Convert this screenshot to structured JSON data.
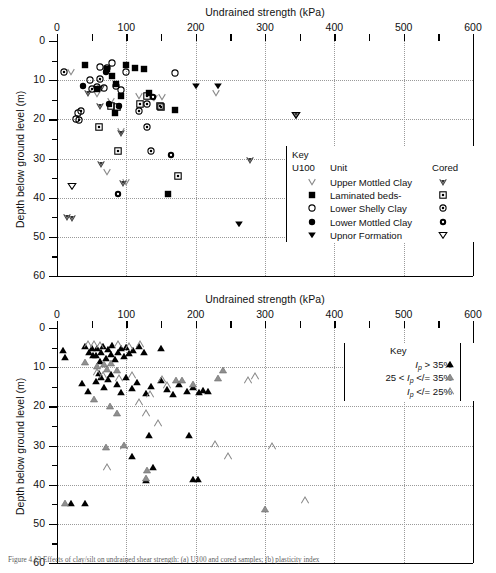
{
  "figure": {
    "caption": "Figure 4.13  Effects of clay/silt on undrained shear strength: (a) U100 and cored samples; (b) plasticity index"
  },
  "chart_data": [
    {
      "id": "top",
      "type": "scatter",
      "title": "",
      "xlabel": "Undrained strength (kPa)",
      "ylabel": "Depth below ground level (m)",
      "xlim": [
        0,
        600
      ],
      "ylim": [
        0,
        60
      ],
      "y_inverted": true,
      "xticks": [
        0,
        100,
        200,
        300,
        400,
        500,
        600
      ],
      "xticks_minor_step": 50,
      "yticks": [
        0,
        10,
        20,
        30,
        40,
        50,
        60
      ],
      "yticks_minor_step": 5,
      "grid": "dotted",
      "legend": {
        "title": "Key",
        "col_left_header": "U100",
        "col_mid_header": "Unit",
        "col_right_header": "Cored",
        "entries": [
          {
            "label": "Upper Mottled Clay",
            "u100": "open-chevron-down",
            "cored": "gray-filled-chevron-down"
          },
          {
            "label": "Laminated beds-",
            "u100": "filled-square",
            "cored": "square-with-dot"
          },
          {
            "label": "Lower Shelly Clay",
            "u100": "open-circle",
            "cored": "circle-with-dot"
          },
          {
            "label": "Lower Mottled Clay",
            "u100": "filled-circle",
            "cored": "filled-circle-with-hole"
          },
          {
            "label": "Upnor Formation",
            "u100": "filled-triangle-down",
            "cored": "open-triangle-down"
          }
        ]
      },
      "series": [
        {
          "name": "Upper Mottled Clay",
          "marker": "open-chevron-down",
          "points": [
            [
              20,
              7.8
            ],
            [
              57,
              13.5
            ],
            [
              78,
              15.2
            ],
            [
              118,
              14.0
            ],
            [
              140,
              14.6
            ],
            [
              152,
              14.3
            ],
            [
              92,
              23.0
            ],
            [
              100,
              36.0
            ],
            [
              72,
              33.5
            ],
            [
              230,
              13.4
            ]
          ]
        },
        {
          "name": "Upper Mottled Clay (cored)",
          "marker": "gray-filled-chevron-down",
          "points": [
            [
              45,
              13.3
            ],
            [
              62,
              16.5
            ],
            [
              64,
              12.0
            ],
            [
              92,
              23.5
            ],
            [
              95,
              36.2
            ],
            [
              63,
              31.5
            ],
            [
              278,
              30.5
            ],
            [
              345,
              19.0
            ],
            [
              14,
              45.0
            ],
            [
              22,
              45.1
            ]
          ]
        },
        {
          "name": "Laminated beds",
          "marker": "filled-square",
          "points": [
            [
              40,
              6.0
            ],
            [
              58,
              12.2
            ],
            [
              72,
              7.2
            ],
            [
              80,
              9.0
            ],
            [
              85,
              11.0
            ],
            [
              92,
              14.0
            ],
            [
              100,
              6.0
            ],
            [
              112,
              7.0
            ],
            [
              126,
              7.2
            ],
            [
              83,
              18.5
            ],
            [
              170,
              17.5
            ],
            [
              132,
              13.2
            ],
            [
              160,
              39.0
            ]
          ]
        },
        {
          "name": "Laminated beds (cored)",
          "marker": "square-with-dot",
          "points": [
            [
              78,
              16.5
            ],
            [
              86,
              16.8
            ],
            [
              120,
              16.0
            ],
            [
              130,
              14.0
            ],
            [
              150,
              16.8
            ],
            [
              148,
              16.5
            ],
            [
              60,
              22.0
            ],
            [
              88,
              28.0
            ],
            [
              175,
              34.5
            ]
          ]
        },
        {
          "name": "Lower Shelly Clay",
          "marker": "open-circle",
          "points": [
            [
              30,
              18.5
            ],
            [
              48,
              10.0
            ],
            [
              57,
              11.8
            ],
            [
              62,
              6.6
            ],
            [
              68,
              12.0
            ],
            [
              72,
              7.0
            ],
            [
              80,
              5.5
            ],
            [
              85,
              11.4
            ],
            [
              92,
              12.5
            ],
            [
              100,
              8.0
            ],
            [
              170,
              8.2
            ],
            [
              28,
              20.0
            ]
          ]
        },
        {
          "name": "Lower Shelly Clay (cored)",
          "marker": "circle-with-dot",
          "points": [
            [
              10,
              7.8
            ],
            [
              35,
              17.8
            ],
            [
              50,
              12.2
            ],
            [
              62,
              9.8
            ],
            [
              118,
              17.8
            ],
            [
              130,
              16.0
            ],
            [
              130,
              22.0
            ],
            [
              135,
              28.0
            ],
            [
              32,
              20.2
            ]
          ]
        },
        {
          "name": "Lower Mottled Clay",
          "marker": "filled-circle",
          "points": [
            [
              38,
              11.4
            ],
            [
              70,
              8.0
            ],
            [
              75,
              16.2
            ],
            [
              90,
              16.5
            ],
            [
              345,
              43.5
            ]
          ]
        },
        {
          "name": "Lower Mottled Clay (cored)",
          "marker": "filled-circle-with-hole",
          "points": [
            [
              138,
              14.2
            ],
            [
              165,
              29.0
            ],
            [
              88,
              39.0
            ]
          ]
        },
        {
          "name": "Upnor Formation",
          "marker": "filled-triangle-down",
          "points": [
            [
              200,
              11.5
            ],
            [
              232,
              11.5
            ],
            [
              262,
              46.8
            ]
          ]
        },
        {
          "name": "Upnor Formation (cored)",
          "marker": "open-triangle-down",
          "points": [
            [
              22,
              37.0
            ],
            [
              345,
              19.0
            ]
          ]
        }
      ]
    },
    {
      "id": "bottom",
      "type": "scatter",
      "title": "",
      "xlabel": "Undrained strength (kPa)",
      "ylabel": "Depth below ground level (m)",
      "xlim": [
        0,
        600
      ],
      "ylim": [
        0,
        60
      ],
      "y_inverted": true,
      "xticks": [
        0,
        100,
        200,
        300,
        400,
        500,
        600
      ],
      "xticks_minor_step": 50,
      "yticks": [
        0,
        10,
        20,
        30,
        40,
        50,
        60
      ],
      "yticks_minor_step": 5,
      "grid": "dotted",
      "legend": {
        "title": "Key",
        "entries": [
          {
            "label_pre": "",
            "symbol_text": "I",
            "sub": "p",
            "rel": "&gt;",
            "value": "35%",
            "marker": "filled-triangle-up"
          },
          {
            "label_pre": "25 &lt;",
            "symbol_text": "I",
            "sub": "p",
            "rel": "&lt;/=",
            "value": "35%",
            "marker": "gray-triangle-up"
          },
          {
            "label_pre": "",
            "symbol_text": "I",
            "sub": "p",
            "rel": "&lt;/=",
            "value": "25%",
            "marker": "open-triangle-up"
          }
        ]
      },
      "series": [
        {
          "name": "Ip > 35%",
          "marker": "filled-triangle-up",
          "points": [
            [
              8,
              5.5
            ],
            [
              12,
              7.5
            ],
            [
              40,
              4.5
            ],
            [
              46,
              6.0
            ],
            [
              50,
              5.2
            ],
            [
              52,
              7.0
            ],
            [
              56,
              6.8
            ],
            [
              58,
              5.0
            ],
            [
              62,
              8.5
            ],
            [
              64,
              6.2
            ],
            [
              66,
              4.6
            ],
            [
              70,
              7.6
            ],
            [
              74,
              5.4
            ],
            [
              78,
              6.6
            ],
            [
              80,
              4.4
            ],
            [
              84,
              8.0
            ],
            [
              88,
              6.0
            ],
            [
              92,
              5.0
            ],
            [
              96,
              7.2
            ],
            [
              100,
              4.8
            ],
            [
              104,
              6.4
            ],
            [
              110,
              5.6
            ],
            [
              118,
              4.5
            ],
            [
              126,
              6.2
            ],
            [
              150,
              5.2
            ],
            [
              36,
              14.0
            ],
            [
              44,
              16.0
            ],
            [
              56,
              13.6
            ],
            [
              60,
              11.5
            ],
            [
              64,
              12.4
            ],
            [
              68,
              15.0
            ],
            [
              74,
              13.0
            ],
            [
              78,
              11.8
            ],
            [
              86,
              14.2
            ],
            [
              92,
              16.4
            ],
            [
              100,
              12.6
            ],
            [
              108,
              15.4
            ],
            [
              116,
              13.8
            ],
            [
              128,
              16.6
            ],
            [
              136,
              14.8
            ],
            [
              150,
              13.2
            ],
            [
              158,
              15.6
            ],
            [
              168,
              16.8
            ],
            [
              176,
              14.4
            ],
            [
              188,
              16.2
            ],
            [
              196,
              15.0
            ],
            [
              205,
              16.4
            ],
            [
              210,
              15.8
            ],
            [
              218,
              16.0
            ],
            [
              132,
              27.2
            ],
            [
              190,
              27.2
            ],
            [
              108,
              32.8
            ],
            [
              138,
              35.4
            ],
            [
              128,
              38.8
            ],
            [
              196,
              38.6
            ],
            [
              204,
              38.6
            ],
            [
              40,
              44.8
            ],
            [
              20,
              44.6
            ]
          ]
        },
        {
          "name": "25 < Ip <= 35%",
          "marker": "gray-triangle-up",
          "points": [
            [
              40,
              8.6
            ],
            [
              58,
              9.8
            ],
            [
              68,
              9.2
            ],
            [
              72,
              10.4
            ],
            [
              78,
              9.0
            ],
            [
              86,
              10.8
            ],
            [
              54,
              18.2
            ],
            [
              76,
              20.0
            ],
            [
              172,
              13.4
            ],
            [
              180,
              13.2
            ],
            [
              196,
              14.4
            ],
            [
              232,
              12.8
            ],
            [
              240,
              10.6
            ],
            [
              86,
              21.8
            ],
            [
              70,
              30.4
            ],
            [
              130,
              36.2
            ],
            [
              128,
              38.4
            ],
            [
              12,
              44.6
            ],
            [
              300,
              46.2
            ],
            [
              96,
              29.8
            ]
          ]
        },
        {
          "name": "Ip <= 25%",
          "marker": "open-triangle-up",
          "points": [
            [
              44,
              4.2
            ],
            [
              54,
              4.0
            ],
            [
              62,
              4.4
            ],
            [
              88,
              4.2
            ],
            [
              104,
              4.6
            ],
            [
              120,
              4.2
            ],
            [
              58,
              11.2
            ],
            [
              66,
              12.0
            ],
            [
              90,
              12.8
            ],
            [
              108,
              12.0
            ],
            [
              152,
              13.0
            ],
            [
              158,
              14.6
            ],
            [
              118,
              18.8
            ],
            [
              128,
              21.6
            ],
            [
              146,
              24.2
            ],
            [
              228,
              29.6
            ],
            [
              246,
              32.6
            ],
            [
              310,
              30.0
            ],
            [
              72,
              35.4
            ],
            [
              358,
              44.0
            ],
            [
              276,
              13.2
            ],
            [
              286,
              12.2
            ],
            [
              96,
              30.2
            ],
            [
              134,
              16.8
            ]
          ]
        }
      ]
    }
  ]
}
